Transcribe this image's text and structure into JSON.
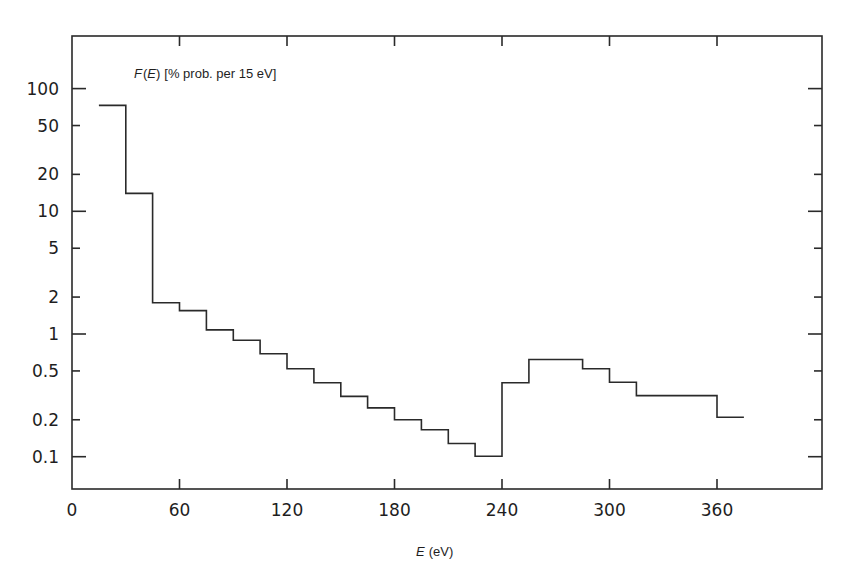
{
  "chart_data": {
    "type": "line",
    "subtype": "step-histogram",
    "title": "",
    "ylabel": {
      "var": "F",
      "arg": "E",
      "rest": "[% prob. per 15 eV]",
      "full": "F(E) [% prob. per 15 eV]"
    },
    "xlabel": {
      "var": "E",
      "rest": "(eV)",
      "full": "E (eV)"
    },
    "xscale": "linear",
    "yscale": "log",
    "xlim": [
      0,
      420
    ],
    "ylim": [
      0.055,
      180
    ],
    "grid": false,
    "legend": null,
    "x_ticks": [
      0,
      60,
      120,
      180,
      240,
      300,
      360
    ],
    "x_tick_labels": [
      "0",
      "60",
      "120",
      "180",
      "240",
      "300",
      "360"
    ],
    "y_ticks": [
      0.1,
      0.2,
      0.5,
      1,
      2,
      5,
      10,
      20,
      50,
      100
    ],
    "y_tick_labels": [
      "0.1",
      "0.2",
      "0.5",
      "1",
      "2",
      "5",
      "10",
      "20",
      "50",
      "100"
    ],
    "y_major_ticks": [
      0.1,
      1,
      10,
      100
    ],
    "bin_width_eV": 15,
    "series": [
      {
        "name": "F(E)",
        "bins": [
          {
            "x_start": 15,
            "x_end": 30,
            "value": 73
          },
          {
            "x_start": 30,
            "x_end": 45,
            "value": 14
          },
          {
            "x_start": 45,
            "x_end": 60,
            "value": 1.8
          },
          {
            "x_start": 60,
            "x_end": 75,
            "value": 1.55
          },
          {
            "x_start": 75,
            "x_end": 90,
            "value": 1.08
          },
          {
            "x_start": 90,
            "x_end": 105,
            "value": 0.89
          },
          {
            "x_start": 105,
            "x_end": 120,
            "value": 0.69
          },
          {
            "x_start": 120,
            "x_end": 135,
            "value": 0.52
          },
          {
            "x_start": 135,
            "x_end": 150,
            "value": 0.4
          },
          {
            "x_start": 150,
            "x_end": 165,
            "value": 0.31
          },
          {
            "x_start": 165,
            "x_end": 180,
            "value": 0.25
          },
          {
            "x_start": 180,
            "x_end": 195,
            "value": 0.2
          },
          {
            "x_start": 195,
            "x_end": 210,
            "value": 0.166
          },
          {
            "x_start": 210,
            "x_end": 225,
            "value": 0.128
          },
          {
            "x_start": 225,
            "x_end": 240,
            "value": 0.101
          },
          {
            "x_start": 240,
            "x_end": 255,
            "value": 0.4
          },
          {
            "x_start": 255,
            "x_end": 285,
            "value": 0.62
          },
          {
            "x_start": 285,
            "x_end": 300,
            "value": 0.52
          },
          {
            "x_start": 300,
            "x_end": 315,
            "value": 0.405
          },
          {
            "x_start": 315,
            "x_end": 360,
            "value": 0.315
          },
          {
            "x_start": 360,
            "x_end": 375,
            "value": 0.21
          }
        ]
      }
    ]
  },
  "colors": {
    "background": "#ffffff",
    "ink": "#2a2a2a"
  }
}
